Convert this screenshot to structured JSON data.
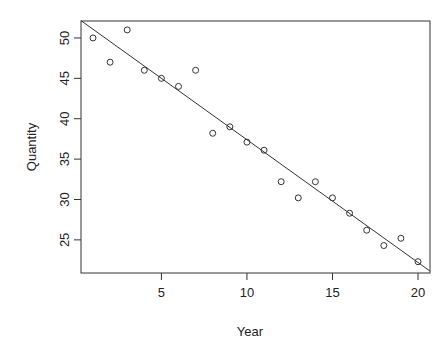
{
  "chart_data": {
    "type": "scatter",
    "title": "",
    "xlabel": "Year",
    "ylabel": "Quantity",
    "x": [
      1,
      2,
      3,
      4,
      5,
      6,
      7,
      8,
      9,
      10,
      11,
      12,
      13,
      14,
      15,
      16,
      17,
      18,
      19,
      20
    ],
    "series": [
      {
        "name": "Quantity",
        "values": [
          50,
          47,
          51,
          46,
          45,
          44,
          46,
          38.2,
          39,
          37.1,
          36.1,
          32.2,
          30.2,
          32.2,
          30.2,
          28.3,
          26.2,
          24.3,
          25.2,
          22.3
        ]
      }
    ],
    "fit_line": {
      "type": "linear",
      "intercept": 52.6,
      "slope": -1.52
    },
    "xticks": [
      5,
      10,
      15,
      20
    ],
    "yticks": [
      25,
      30,
      35,
      40,
      45,
      50
    ],
    "xlim": [
      0.3,
      20.7
    ],
    "ylim": [
      20.9,
      52.1
    ],
    "grid": false,
    "legend": null
  },
  "labels": {
    "xlabel": "Year",
    "ylabel": "Quantity"
  }
}
